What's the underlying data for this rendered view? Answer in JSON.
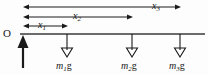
{
  "figure": {
    "background_color": "#fdfdfd",
    "stroke_color": "#1a1a1a",
    "origin": {
      "label": "O",
      "x": 23,
      "y": 34
    },
    "beam": {
      "x_start": 20,
      "x_end": 205,
      "y": 34
    },
    "reaction_arrow": {
      "name": "upward-reaction-arrow",
      "x": 23,
      "y_tail": 68,
      "y_head": 36,
      "head_style": "filled",
      "direction": "up"
    },
    "dimension_arrows": [
      {
        "label": "x",
        "subscript": "1",
        "x_start": 23,
        "x_end": 68,
        "y": 26,
        "label_x": 38,
        "label_y": 20,
        "double_headed": true
      },
      {
        "label": "x",
        "subscript": "2",
        "x_start": 23,
        "x_end": 133,
        "y": 17,
        "label_x": 73,
        "label_y": 11,
        "double_headed": true
      },
      {
        "label": "x",
        "subscript": "3",
        "x_start": 23,
        "x_end": 181,
        "y": 7,
        "label_x": 152,
        "label_y": 1,
        "double_headed": true
      }
    ],
    "force_arrows": [
      {
        "name": "weight-arrow-m1g",
        "mass_symbol": "m",
        "subscript": "1",
        "gravity_symbol": "g",
        "x": 67,
        "y_tail": 34,
        "y_head": 57,
        "head_style": "hollow",
        "direction": "down",
        "label_x": 56,
        "label_y": 61
      },
      {
        "name": "weight-arrow-m2g",
        "mass_symbol": "m",
        "subscript": "2",
        "gravity_symbol": "g",
        "x": 132,
        "y_tail": 34,
        "y_head": 57,
        "head_style": "hollow",
        "direction": "down",
        "label_x": 121,
        "label_y": 61
      },
      {
        "name": "weight-arrow-m3g",
        "mass_symbol": "m",
        "subscript": "3",
        "gravity_symbol": "g",
        "x": 180,
        "y_tail": 34,
        "y_head": 57,
        "head_style": "hollow",
        "direction": "down",
        "label_x": 169,
        "label_y": 61
      }
    ]
  }
}
